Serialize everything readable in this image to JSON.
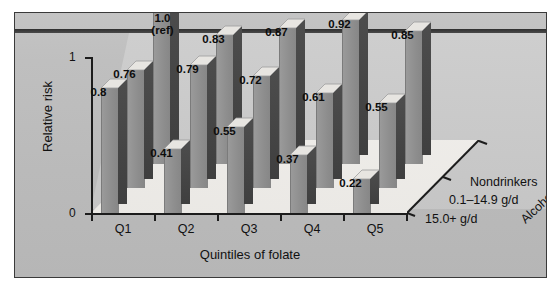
{
  "chart_data": {
    "type": "bar",
    "title": "",
    "subtitle": "",
    "xlabel": "Quintiles of folate",
    "ylabel": "Relative risk",
    "zlabel": "Alcohol",
    "categories": [
      "Q1",
      "Q2",
      "Q3",
      "Q4",
      "Q5"
    ],
    "ytick_labels": [
      "0",
      "1"
    ],
    "ylim": [
      0,
      1
    ],
    "grid": false,
    "legend_position": "depth-axis-right",
    "series": [
      {
        "name": "15.0+ g/d",
        "values": [
          0.8,
          0.41,
          0.55,
          0.37,
          0.22
        ],
        "labels": [
          "0.8",
          "0.41",
          "0.55",
          "0.37",
          "0.22"
        ]
      },
      {
        "name": "0.1–14.9 g/d",
        "values": [
          0.76,
          0.79,
          0.72,
          0.61,
          0.55
        ],
        "labels": [
          "0.76",
          "0.79",
          "0.72",
          "0.61",
          "0.55"
        ]
      },
      {
        "name": "Nondrinkers",
        "values": [
          1.0,
          0.83,
          0.87,
          0.92,
          0.85
        ],
        "labels": [
          "1.0\n(ref)",
          "0.83",
          "0.87",
          "0.92",
          "0.85"
        ]
      }
    ],
    "annotations": [
      {
        "text": "1.0 (ref)",
        "note": "reference category: Q1 nondrinkers"
      }
    ],
    "colors": {
      "bar_face": "#8d8d8d",
      "bar_side": "#454545",
      "bar_top": "#e7e5e1",
      "back_wall": "#c9c9c9",
      "floor": "#efedea",
      "card_background": "#bdbdbd",
      "axis": "#1c1c1c",
      "text": "#111111"
    }
  },
  "axes": {
    "y": {
      "label": "Relative risk",
      "ticks": [
        "1",
        "0"
      ]
    },
    "x": {
      "label": "Quintiles of folate",
      "ticks": [
        "Q1",
        "Q2",
        "Q3",
        "Q4",
        "Q5"
      ]
    },
    "z": {
      "label": "Alcohol",
      "ticks": [
        "Nondrinkers",
        "0.1–14.9 g/d",
        "15.0+ g/d"
      ]
    }
  },
  "labels": {
    "ref_main": "1.0",
    "ref_sub": "(ref)"
  }
}
